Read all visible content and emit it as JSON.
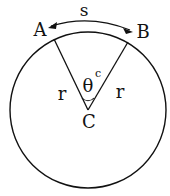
{
  "diagram": {
    "type": "circle-sector-arc",
    "labels": {
      "point_a": "A",
      "point_b": "B",
      "center": "C",
      "arc_length": "s",
      "radius_left": "r",
      "radius_right": "r",
      "angle": "θ",
      "angle_unit": "c"
    },
    "colors": {
      "stroke": "#111111",
      "background": "#ffffff"
    }
  }
}
